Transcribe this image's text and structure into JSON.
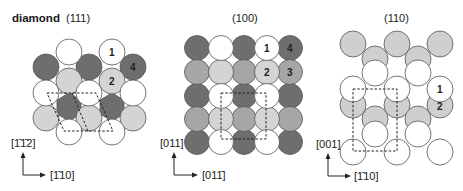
{
  "figure": {
    "title": "diamond",
    "colors": {
      "white": "#ffffff",
      "light": "#d4d4d4",
      "mid": "#a6a6a6",
      "dark": "#6e6e6e",
      "gray110": "#cfcfcf"
    },
    "panels": [
      {
        "id": "p111",
        "label": "(111)",
        "axis_vertical": "[1̄1̄2]",
        "axis_horizontal": "[1̄10]"
      },
      {
        "id": "p100",
        "label": "(100)",
        "axis_vertical": "[011]",
        "axis_horizontal": "[011̄]"
      },
      {
        "id": "p110",
        "label": "(110)",
        "axis_vertical": "[001]",
        "axis_horizontal": "[1̄10]"
      }
    ],
    "layer_numbers": {
      "p111": [
        "1",
        "2",
        "4"
      ],
      "p100": [
        "1",
        "2",
        "3",
        "4"
      ],
      "p110": [
        "1",
        "2"
      ]
    }
  }
}
